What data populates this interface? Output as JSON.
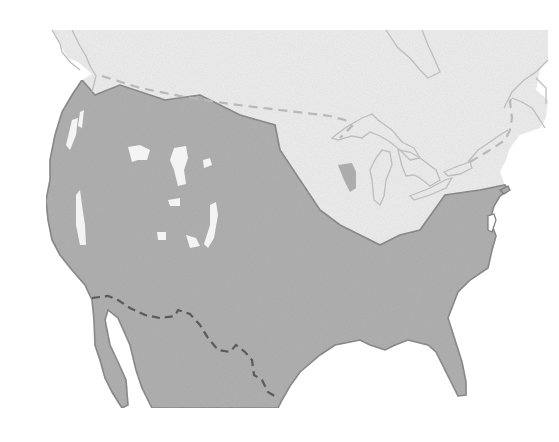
{
  "map": {
    "title": "",
    "description": "Grayscale range map of North America showing a species distribution across the contiguous United States",
    "colors": {
      "background": "#ffffff",
      "non_range_land": "#efefef",
      "range": "#a9a9a9",
      "coastline": "#7a7a7a",
      "lake_outline": "#bdbdbd",
      "canada_border": "#b8b8b8",
      "mexico_border": "#5a5a5a",
      "range_gaps": "#f4f4f4"
    },
    "regions": [
      {
        "name": "Canada",
        "shading": "light",
        "in_range": false
      },
      {
        "name": "Contiguous United States",
        "shading": "dark",
        "in_range": true
      },
      {
        "name": "Northern Mexico",
        "shading": "dark",
        "in_range": true
      },
      {
        "name": "Great Lakes region / Northeast",
        "shading": "light",
        "in_range": false
      },
      {
        "name": "Rocky Mountain high-elevation patches",
        "shading": "light",
        "in_range": false
      }
    ],
    "borders": [
      {
        "name": "US-Canada border",
        "style": "dashed"
      },
      {
        "name": "US-Mexico border",
        "style": "dashed"
      }
    ],
    "labels": []
  }
}
